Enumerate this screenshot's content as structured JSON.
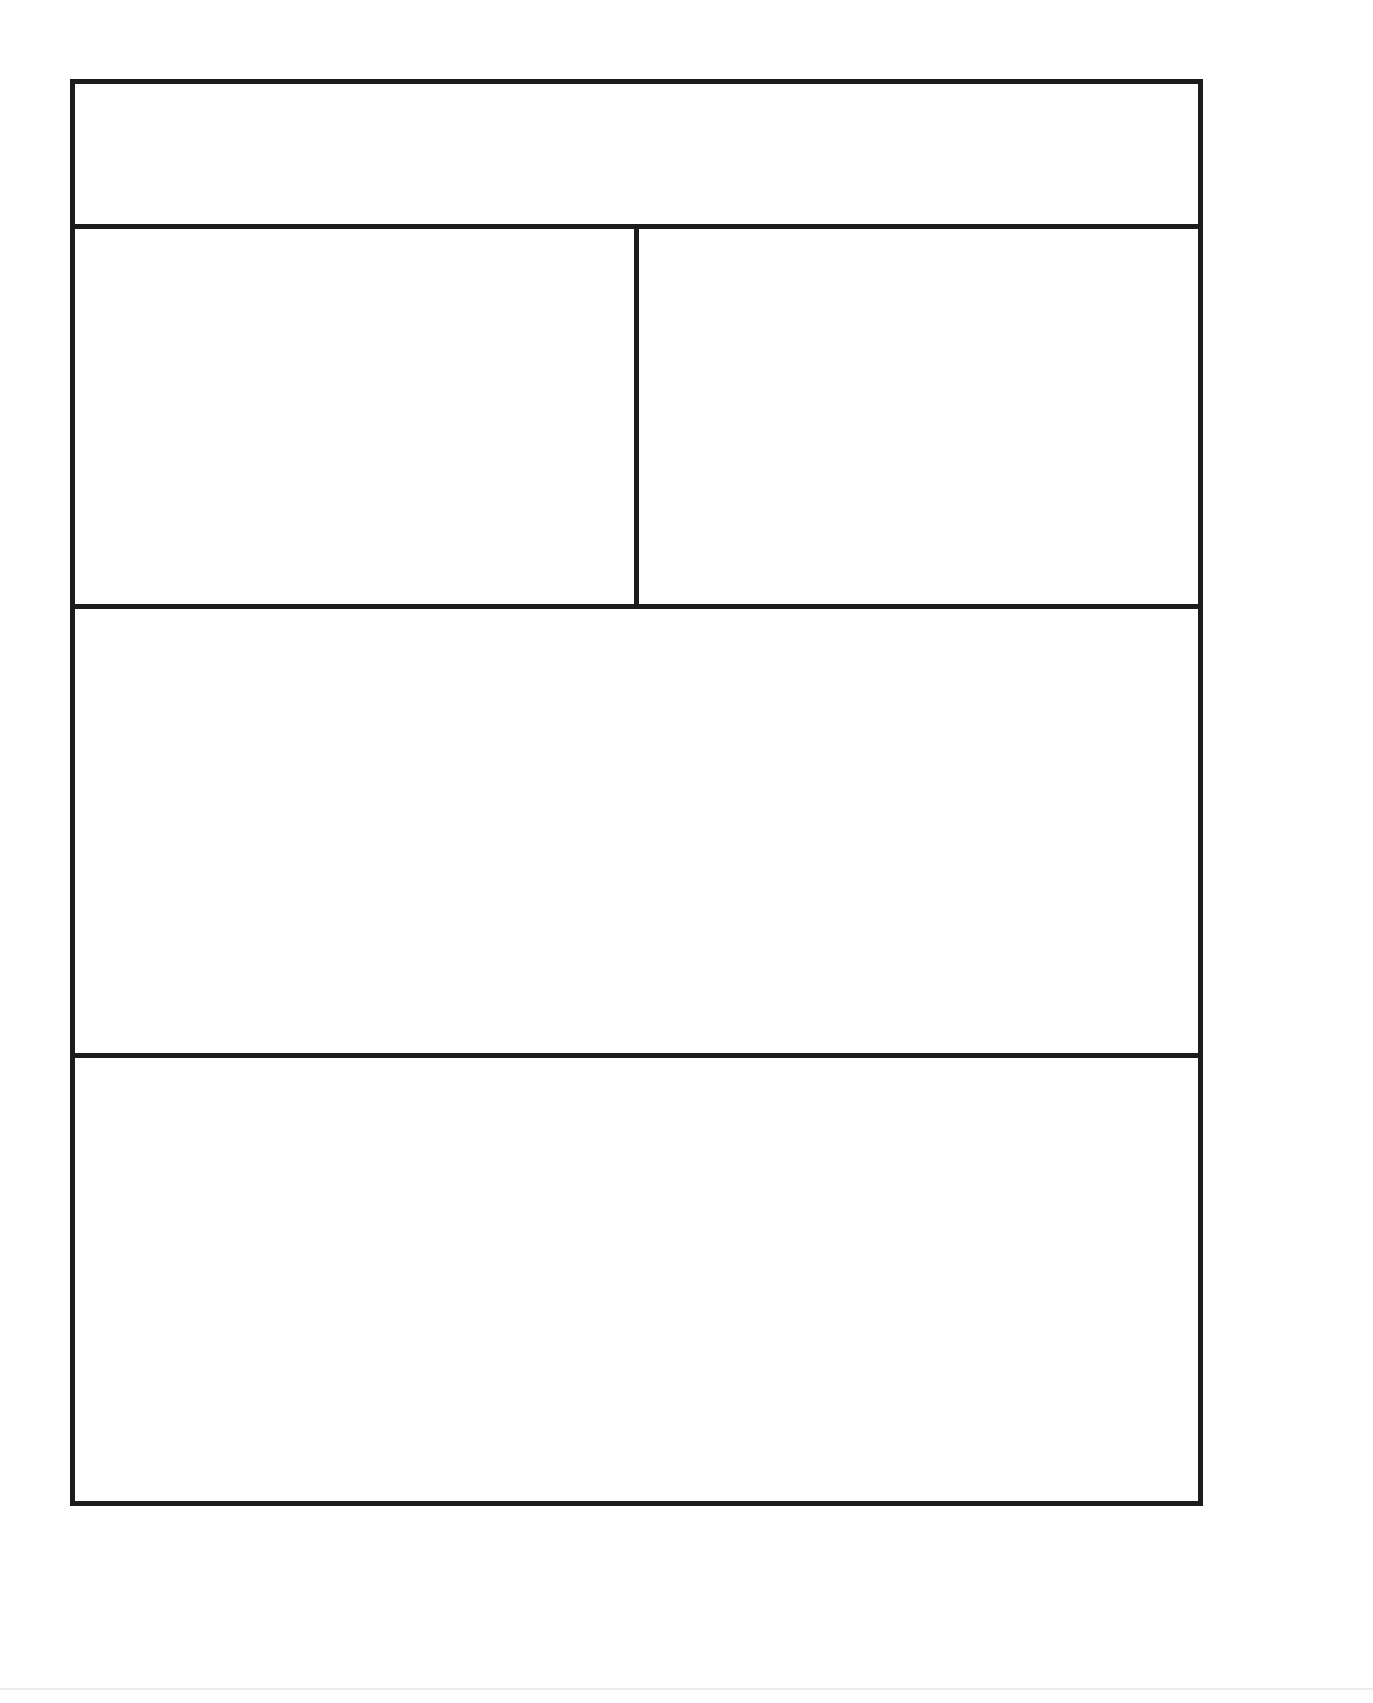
{
  "template": {
    "header": {
      "label": ""
    },
    "row1": {
      "left": {
        "label": ""
      },
      "right": {
        "label": ""
      }
    },
    "row2": {
      "label": ""
    },
    "row3": {
      "label": ""
    }
  },
  "colors": {
    "line": "#1c1c1c",
    "background": "#ffffff"
  }
}
